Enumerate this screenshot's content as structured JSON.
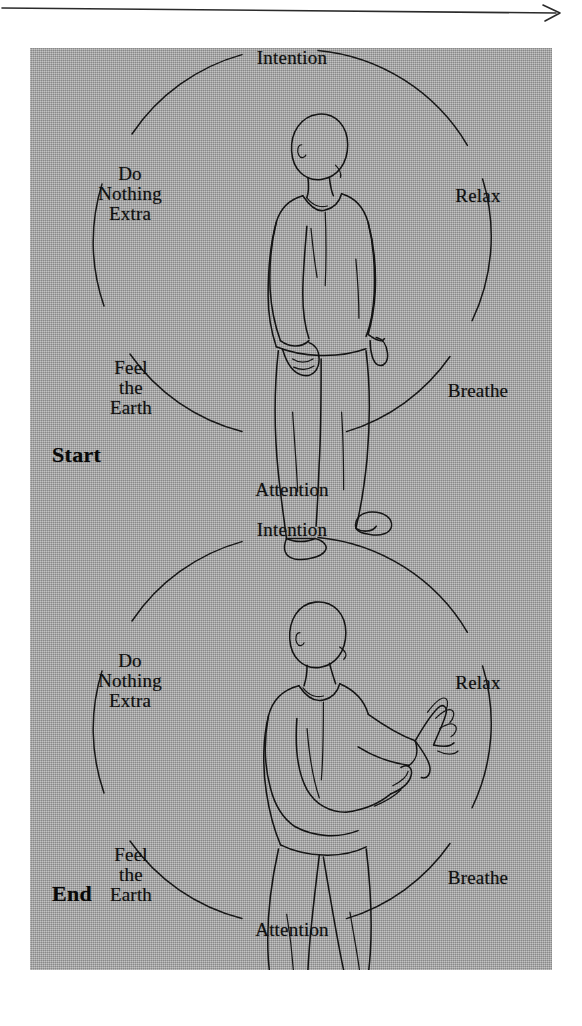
{
  "figure": {
    "top_arrow": {
      "name": "time-direction-arrow",
      "direction": "right",
      "alt": "horizontal arrow pointing right"
    },
    "panel": {
      "background_color": "#a9a9a9",
      "border_color": "#8f8f8f"
    },
    "ink_color": "#111111",
    "cycles": [
      {
        "id": "start-cycle",
        "corner_label": "Start",
        "figure_pose": "standing-relaxed-arms-at-sides",
        "ring_labels": [
          {
            "key": "intention",
            "text": "Intention"
          },
          {
            "key": "relax",
            "text": "Relax"
          },
          {
            "key": "breathe",
            "text": "Breathe"
          },
          {
            "key": "attention",
            "text": "Attention"
          },
          {
            "key": "feel-the-earth",
            "text": "Feel\nthe\nEarth"
          },
          {
            "key": "do-nothing-extra",
            "text": "Do\nNothing\nExtra"
          }
        ]
      },
      {
        "id": "end-cycle",
        "corner_label": "End",
        "figure_pose": "tai-chi-hands-raised-forward",
        "ring_labels": [
          {
            "key": "intention",
            "text": "Intention"
          },
          {
            "key": "relax",
            "text": "Relax"
          },
          {
            "key": "breathe",
            "text": "Breathe"
          },
          {
            "key": "attention",
            "text": "Attention"
          },
          {
            "key": "feel-the-earth",
            "text": "Feel\nthe\nEarth"
          },
          {
            "key": "do-nothing-extra",
            "text": "Do\nNothing\nExtra"
          }
        ]
      }
    ]
  }
}
